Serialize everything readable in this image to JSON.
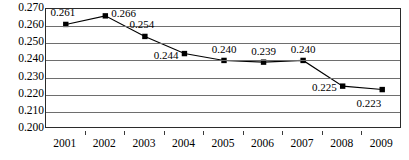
{
  "chart_data": {
    "type": "line",
    "title": "",
    "subtitle": "",
    "xlabel": "",
    "ylabel": "",
    "categories": [
      "2001",
      "2002",
      "2003",
      "2004",
      "2005",
      "2006",
      "2007",
      "2008",
      "2009"
    ],
    "values": [
      0.261,
      0.266,
      0.254,
      0.244,
      0.24,
      0.239,
      0.24,
      0.225,
      0.223
    ],
    "point_labels": [
      "0.261",
      "0.266",
      "0.254",
      "0.244",
      "0.240",
      "0.239",
      "0.240",
      "0.225",
      "0.223"
    ],
    "label_positions": [
      "above-right",
      "right",
      "above-right",
      "left",
      "above",
      "above",
      "above",
      "left",
      "below-left"
    ],
    "ylim": [
      0.2,
      0.27
    ],
    "ytick_values": [
      0.27,
      0.26,
      0.25,
      0.24,
      0.23,
      0.22,
      0.21,
      0.2
    ],
    "ytick_labels": [
      "0.270",
      "0.260",
      "0.250",
      "0.240",
      "0.230",
      "0.220",
      "0.210",
      "0.200"
    ],
    "grid": true,
    "grid_orientation": "horizontal",
    "legend": false,
    "legend_position": "none",
    "marker": "square",
    "colors": {
      "line": "#000000",
      "marker": "#000000",
      "gridline": "#6e6e6e",
      "axis_border": "#2b2b2b",
      "text": "#000000",
      "background": "#ffffff"
    }
  }
}
